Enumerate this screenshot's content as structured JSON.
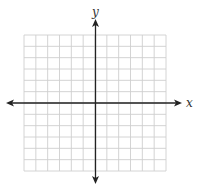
{
  "diagram": {
    "type": "coordinate-plane",
    "x_axis_label": "x",
    "y_axis_label": "y",
    "grid": {
      "columns": 12,
      "rows": 12,
      "left": 24,
      "top": 35,
      "right": 166,
      "bottom": 171,
      "line_color": "#cfcfcf"
    },
    "axes": {
      "color": "#222222",
      "origin_x": 95.5,
      "origin_y": 103,
      "x_start": 6,
      "x_end": 182,
      "y_start": 19,
      "y_end": 184,
      "arrowheads": "both-ends"
    }
  }
}
